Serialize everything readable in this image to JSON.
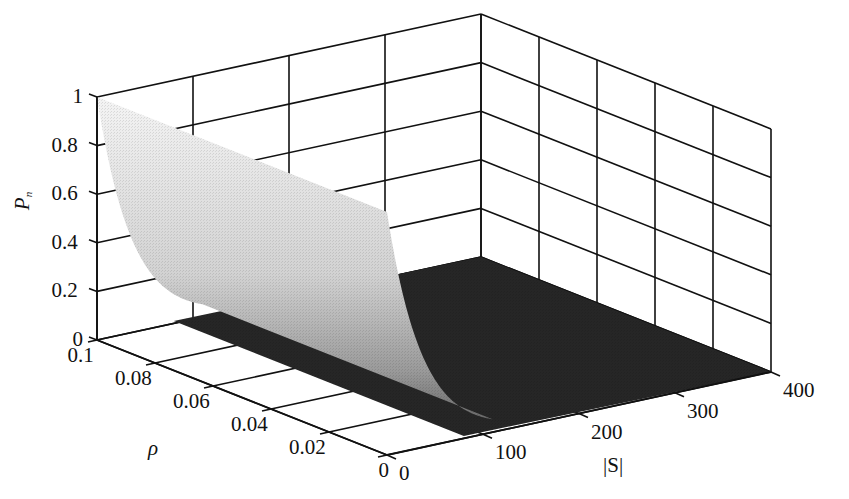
{
  "chart_data": {
    "type": "surface3d",
    "title": "",
    "xlabel": "|S|",
    "ylabel": "ρ",
    "zlabel": "P_n",
    "x_axis": {
      "label": "|S|",
      "range": [
        0,
        400
      ],
      "ticks": [
        0,
        100,
        200,
        300,
        400
      ]
    },
    "y_axis": {
      "label": "ρ",
      "range": [
        0,
        0.1
      ],
      "ticks": [
        0,
        0.02,
        0.04,
        0.06,
        0.08,
        0.1
      ]
    },
    "z_axis": {
      "label": "P_n",
      "range": [
        0,
        1
      ],
      "ticks": [
        0,
        0.2,
        0.4,
        0.6,
        0.8,
        1
      ]
    },
    "grid": true,
    "x": [
      0,
      10,
      20,
      30,
      40,
      50,
      60,
      70,
      80,
      100,
      150,
      200,
      300,
      400
    ],
    "series": [
      {
        "name": "P_n (any ρ in [0, 0.1])",
        "values": [
          1.0,
          0.78,
          0.6,
          0.45,
          0.33,
          0.23,
          0.15,
          0.09,
          0.05,
          0.01,
          0.0,
          0.0,
          0.0,
          0.0
        ]
      }
    ]
  },
  "labels": {
    "z_title_main": "P",
    "z_title_sub": "n",
    "y_title": "ρ",
    "x_title": "|S|",
    "z_ticks": [
      "0",
      "0.2",
      "0.4",
      "0.6",
      "0.8",
      "1"
    ],
    "y_ticks": [
      "0",
      "0.02",
      "0.04",
      "0.06",
      "0.08",
      "0.1"
    ],
    "x_ticks": [
      "0",
      "100",
      "200",
      "300",
      "400"
    ]
  }
}
